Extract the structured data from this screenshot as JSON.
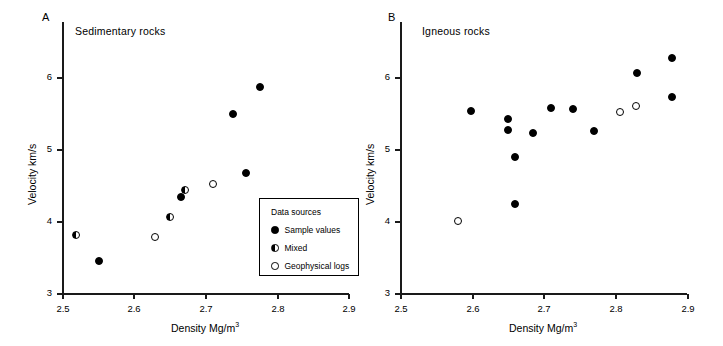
{
  "figure": {
    "background": "#ffffff",
    "ink_color": "#000000"
  },
  "legend": {
    "title": "Data sources",
    "entries": [
      {
        "marker": "filled-circle-icon",
        "label": "Sample values"
      },
      {
        "marker": "half-filled-circle-icon",
        "label": "Mixed"
      },
      {
        "marker": "open-circle-icon",
        "label": "Geophysical logs"
      }
    ]
  },
  "chart_data": [
    {
      "type": "scatter",
      "panel": "A",
      "title": "Sedimentary rocks",
      "xlabel": "Density Mg/m³",
      "ylabel": "Velocity km/s",
      "xlim": [
        2.5,
        2.9
      ],
      "ylim": [
        3,
        6.5
      ],
      "xticks": [
        2.5,
        2.6,
        2.7,
        2.8,
        2.9
      ],
      "xtick_labels": [
        "2.5",
        "2.6",
        "2.7",
        "2.8",
        "2.9"
      ],
      "yticks": [
        3,
        4,
        5,
        6
      ],
      "ytick_labels": [
        "3",
        "4",
        "5",
        "6"
      ],
      "grid": false,
      "legend_position": "lower-right",
      "series": [
        {
          "name": "Sample values",
          "marker": "filled-circle",
          "points": [
            {
              "x": 2.551,
              "y": 3.45
            },
            {
              "x": 2.666,
              "y": 4.33
            },
            {
              "x": 2.739,
              "y": 5.48
            },
            {
              "x": 2.756,
              "y": 4.67
            },
            {
              "x": 2.776,
              "y": 5.86
            }
          ]
        },
        {
          "name": "Mixed",
          "marker": "half-filled-circle",
          "points": [
            {
              "x": 2.519,
              "y": 3.81
            },
            {
              "x": 2.65,
              "y": 4.06
            },
            {
              "x": 2.671,
              "y": 4.43
            }
          ]
        },
        {
          "name": "Geophysical logs",
          "marker": "open-circle",
          "points": [
            {
              "x": 2.629,
              "y": 3.78
            },
            {
              "x": 2.71,
              "y": 4.52
            }
          ]
        }
      ]
    },
    {
      "type": "scatter",
      "panel": "B",
      "title": "Igneous rocks",
      "xlabel": "Density Mg/m³",
      "ylabel": "Velocity km/s",
      "xlim": [
        2.5,
        2.9
      ],
      "ylim": [
        3,
        6.5
      ],
      "xticks": [
        2.5,
        2.6,
        2.7,
        2.8,
        2.9
      ],
      "xtick_labels": [
        "2.5",
        "2.6",
        "2.7",
        "2.8",
        "2.9"
      ],
      "yticks": [
        3,
        4,
        5,
        6
      ],
      "ytick_labels": [
        "3",
        "4",
        "5",
        "6"
      ],
      "grid": false,
      "legend_position": "none",
      "series": [
        {
          "name": "Sample values",
          "marker": "filled-circle",
          "points": [
            {
              "x": 2.599,
              "y": 5.53
            },
            {
              "x": 2.65,
              "y": 5.42
            },
            {
              "x": 2.651,
              "y": 5.27
            },
            {
              "x": 2.66,
              "y": 4.89
            },
            {
              "x": 2.66,
              "y": 4.24
            },
            {
              "x": 2.686,
              "y": 5.22
            },
            {
              "x": 2.711,
              "y": 5.57
            },
            {
              "x": 2.741,
              "y": 5.56
            },
            {
              "x": 2.77,
              "y": 5.25
            },
            {
              "x": 2.831,
              "y": 6.06
            },
            {
              "x": 2.879,
              "y": 6.27
            },
            {
              "x": 2.879,
              "y": 5.72
            }
          ]
        },
        {
          "name": "Geophysical logs",
          "marker": "open-circle",
          "points": [
            {
              "x": 2.581,
              "y": 4.0
            },
            {
              "x": 2.807,
              "y": 5.51
            },
            {
              "x": 2.829,
              "y": 5.6
            }
          ]
        }
      ]
    }
  ]
}
